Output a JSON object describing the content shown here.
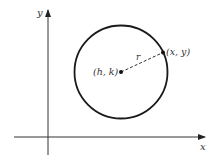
{
  "diagram": {
    "type": "circle-equation",
    "axes": {
      "x_label": "x",
      "y_label": "y"
    },
    "circle": {
      "center_label": "(h, k)",
      "point_label": "(x, y)",
      "radius_label": "r"
    },
    "colors": {
      "stroke": "#1a1a1a",
      "axis": "#333333",
      "text": "#333333",
      "background": "#ffffff"
    }
  }
}
